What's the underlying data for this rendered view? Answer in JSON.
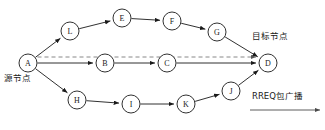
{
  "diagram": {
    "title_text": "RREQ broadcast routing diagram",
    "colors": {
      "stroke": "#1a1a1a",
      "dashed": "#7a7a7a",
      "background": "#ffffff",
      "legend": "#4a4a4a"
    },
    "nodes": [
      {
        "id": "A",
        "label": "A",
        "cx": 28,
        "cy": 63,
        "r": 9
      },
      {
        "id": "L",
        "label": "L",
        "cx": 70,
        "cy": 31,
        "r": 9
      },
      {
        "id": "E",
        "label": "E",
        "cx": 122,
        "cy": 18,
        "r": 9
      },
      {
        "id": "F",
        "label": "F",
        "cx": 172,
        "cy": 21,
        "r": 9
      },
      {
        "id": "G",
        "label": "G",
        "cx": 217,
        "cy": 32,
        "r": 9
      },
      {
        "id": "B",
        "label": "B",
        "cx": 105,
        "cy": 63,
        "r": 9
      },
      {
        "id": "C",
        "label": "C",
        "cx": 167,
        "cy": 63,
        "r": 9
      },
      {
        "id": "D",
        "label": "D",
        "cx": 268,
        "cy": 63,
        "r": 9
      },
      {
        "id": "H",
        "label": "H",
        "cx": 77,
        "cy": 100,
        "r": 9
      },
      {
        "id": "I",
        "label": "I",
        "cx": 131,
        "cy": 104,
        "r": 9
      },
      {
        "id": "K",
        "label": "K",
        "cx": 186,
        "cy": 104,
        "r": 9
      },
      {
        "id": "J",
        "label": "J",
        "cx": 231,
        "cy": 91,
        "r": 9
      }
    ],
    "edges": [
      {
        "from": "A",
        "to": "L",
        "style": "solid"
      },
      {
        "from": "L",
        "to": "E",
        "style": "solid"
      },
      {
        "from": "E",
        "to": "F",
        "style": "solid"
      },
      {
        "from": "F",
        "to": "G",
        "style": "solid"
      },
      {
        "from": "G",
        "to": "D",
        "style": "solid"
      },
      {
        "from": "A",
        "to": "B",
        "style": "solid"
      },
      {
        "from": "B",
        "to": "C",
        "style": "solid"
      },
      {
        "from": "C",
        "to": "D",
        "style": "solid"
      },
      {
        "from": "A",
        "to": "H",
        "style": "solid"
      },
      {
        "from": "H",
        "to": "I",
        "style": "solid"
      },
      {
        "from": "I",
        "to": "K",
        "style": "solid"
      },
      {
        "from": "K",
        "to": "J",
        "style": "solid"
      },
      {
        "from": "J",
        "to": "D",
        "style": "solid"
      },
      {
        "from": "A",
        "to": "D",
        "style": "dashed"
      }
    ],
    "annotations": {
      "source_node": {
        "text": "源节点",
        "x": 4,
        "y": 74
      },
      "target_node": {
        "text": "目标节点",
        "x": 252,
        "y": 32
      },
      "legend_label": {
        "text": "RREQ包广播",
        "x": 252,
        "y": 92
      }
    },
    "legend_arrow": {
      "x1": 250,
      "y1": 110,
      "x2": 320,
      "y2": 110
    }
  }
}
